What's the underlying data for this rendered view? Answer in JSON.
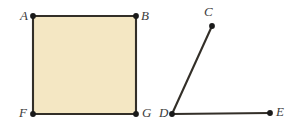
{
  "figure": {
    "background_color": "#ffffff",
    "stroke_color": "#332f28",
    "fill_color": "#f4e7c3",
    "label_color": "#3c3c3c",
    "point_color": "#1a1a1a",
    "canvas": {
      "width": 303,
      "height": 134
    },
    "shapes": [
      {
        "name": "square-abgf",
        "type": "polygon",
        "vertices": [
          "A",
          "B",
          "G",
          "F"
        ],
        "filled": true
      },
      {
        "name": "angle-cde",
        "type": "polyline",
        "vertices": [
          "C",
          "D",
          "E"
        ],
        "filled": false
      }
    ],
    "points": [
      {
        "id": "A",
        "label": "A",
        "x": 33,
        "y": 16,
        "label_x": 20,
        "label_y": 9
      },
      {
        "id": "B",
        "label": "B",
        "x": 136,
        "y": 16,
        "label_x": 141,
        "label_y": 9
      },
      {
        "id": "C",
        "label": "C",
        "x": 212,
        "y": 26,
        "label_x": 204,
        "label_y": 5
      },
      {
        "id": "D",
        "label": "D",
        "x": 172,
        "y": 114,
        "label_x": 159,
        "label_y": 106
      },
      {
        "id": "E",
        "label": "E",
        "x": 270,
        "y": 113,
        "label_x": 276,
        "label_y": 105
      },
      {
        "id": "F",
        "label": "F",
        "x": 33,
        "y": 114,
        "label_x": 19,
        "label_y": 106
      },
      {
        "id": "G",
        "label": "G",
        "x": 136,
        "y": 114,
        "label_x": 142,
        "label_y": 106
      }
    ],
    "segments": [
      {
        "name": "segment-ab",
        "from": "A",
        "to": "B"
      },
      {
        "name": "segment-bg",
        "from": "B",
        "to": "G"
      },
      {
        "name": "segment-gf",
        "from": "G",
        "to": "F"
      },
      {
        "name": "segment-fa",
        "from": "F",
        "to": "A"
      },
      {
        "name": "segment-dc",
        "from": "D",
        "to": "C"
      },
      {
        "name": "segment-de",
        "from": "D",
        "to": "E"
      }
    ]
  }
}
